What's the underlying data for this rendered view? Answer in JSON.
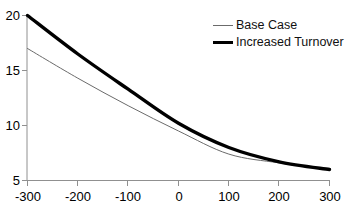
{
  "chart_data": {
    "type": "line",
    "title": "",
    "xlabel": "",
    "ylabel": "",
    "xlim": [
      -300,
      300
    ],
    "ylim": [
      5,
      20
    ],
    "grid": false,
    "legend_position": "top-right",
    "x": [
      -300,
      -200,
      -100,
      0,
      100,
      200,
      300
    ],
    "xticks": [
      "-300",
      "-200",
      "-100",
      "0",
      "100",
      "200",
      "300"
    ],
    "yticks": [
      "5",
      "10",
      "15",
      "20"
    ],
    "ytick_values": [
      5,
      10,
      15,
      20
    ],
    "series": [
      {
        "name": "Base Case",
        "style": "thin",
        "color": "#6b6b6b",
        "values": [
          17.0,
          14.3,
          11.8,
          9.5,
          7.4,
          6.6,
          6.0
        ]
      },
      {
        "name": "Increased Turnover",
        "style": "thick",
        "color": "#000000",
        "values": [
          20.0,
          16.5,
          13.3,
          10.2,
          8.0,
          6.7,
          6.0
        ]
      }
    ]
  },
  "axis": {
    "y_ticks": [
      {
        "label": "20",
        "value": 20
      },
      {
        "label": "15",
        "value": 15
      },
      {
        "label": "10",
        "value": 10
      },
      {
        "label": "5",
        "value": 5
      }
    ],
    "x_ticks": [
      {
        "label": "-300",
        "value": -300
      },
      {
        "label": "-200",
        "value": -200
      },
      {
        "label": "-100",
        "value": -100
      },
      {
        "label": "0",
        "value": 0
      },
      {
        "label": "100",
        "value": 100
      },
      {
        "label": "200",
        "value": 200
      },
      {
        "label": "300",
        "value": 300
      }
    ]
  },
  "legend": {
    "items": [
      {
        "label": "Base Case",
        "style": "thin"
      },
      {
        "label": "Increased Turnover",
        "style": "thick"
      }
    ]
  },
  "colors": {
    "axis": "#808080",
    "base_case": "#6b6b6b",
    "increased_turnover": "#000000",
    "background": "#ffffff",
    "text": "#000000"
  }
}
